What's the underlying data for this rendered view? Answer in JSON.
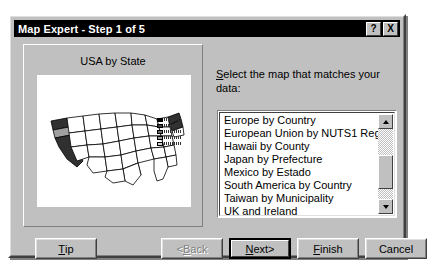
{
  "window": {
    "title": "Map Expert - Step 1 of 5",
    "help_button": "?",
    "close_button": "X",
    "titlebar_color": "#000000",
    "face_color": "#c0c0c0"
  },
  "preview": {
    "title": "USA by State",
    "map_name": "united-states-map",
    "highlighted_states": [
      {
        "name": "Washington",
        "shade": "#303030"
      },
      {
        "name": "Oregon",
        "shade": "#a0a0a0"
      },
      {
        "name": "California",
        "shade": "#303030"
      },
      {
        "name": "New Jersey",
        "shade": "#303030"
      }
    ],
    "legend_rows": 5
  },
  "selector": {
    "instruction_prefix": "S",
    "instruction_rest": "elect the map that matches your data:",
    "selected_value": "USA by State",
    "highlight_color": "#000080",
    "options": [
      "Europe by Country",
      "European Union by NUTS1 Region",
      "Hawaii by County",
      "Japan by Prefecture",
      "Mexico by Estado",
      "South America by Country",
      "Taiwan by Municipality",
      "UK and Ireland",
      "USA by State"
    ],
    "scrollbar": {
      "up_arrow": "▲",
      "down_arrow": "▼"
    }
  },
  "buttons": {
    "tip": {
      "accel": "T",
      "rest": "ip",
      "enabled": true,
      "default": false
    },
    "back": {
      "accel": "B",
      "rest": "ack",
      "prefix": "< ",
      "enabled": false,
      "default": false
    },
    "next": {
      "accel": "N",
      "rest": "ext",
      "suffix": " >",
      "enabled": true,
      "default": true
    },
    "finish": {
      "accel": "F",
      "rest": "inish",
      "enabled": true,
      "default": false
    },
    "cancel": {
      "accel": "",
      "rest": "Cancel",
      "enabled": true,
      "default": false
    }
  }
}
